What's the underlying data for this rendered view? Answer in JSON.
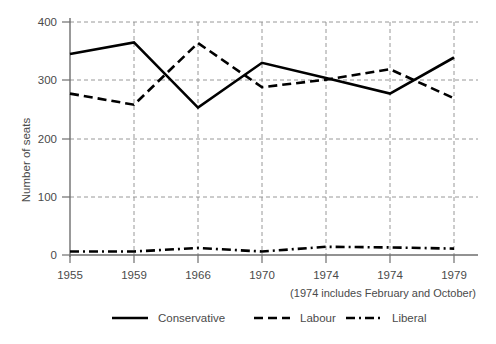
{
  "chart_data": {
    "type": "line",
    "title": "",
    "xlabel": "",
    "ylabel": "Number of seats",
    "categories": [
      "1955",
      "1959",
      "1966",
      "1970",
      "1974",
      "1974",
      "1979"
    ],
    "x_tick_labels": [
      "1955",
      "1959",
      "1966",
      "1970",
      "1974",
      "1974",
      "1979"
    ],
    "y_tick_labels": [
      "0",
      "100",
      "200",
      "300",
      "400"
    ],
    "ylim": [
      0,
      400
    ],
    "y_ticks": [
      0,
      100,
      200,
      300,
      400
    ],
    "grid": "horizontal-and-vertical-dashed",
    "legend_position": "bottom",
    "annotation": "(1974 includes February and October)",
    "series": [
      {
        "name": "Conservative",
        "style": "solid",
        "color": "#000000",
        "values": [
          345,
          365,
          253,
          330,
          304,
          277,
          339
        ]
      },
      {
        "name": "Labour",
        "style": "dashed",
        "color": "#000000",
        "values": [
          277,
          258,
          364,
          288,
          301,
          319,
          269
        ]
      },
      {
        "name": "Liberal",
        "style": "dash-dot",
        "color": "#000000",
        "values": [
          6,
          6,
          12,
          6,
          14,
          13,
          11
        ]
      }
    ]
  },
  "axis": {
    "y_title": "Number of seats"
  },
  "note": {
    "text": "(1974 includes February and October)"
  },
  "legend": {
    "items": [
      {
        "label": "Conservative",
        "style": "solid"
      },
      {
        "label": "Labour",
        "style": "dashed"
      },
      {
        "label": "Liberal",
        "style": "dash-dot"
      }
    ]
  },
  "ticks": {
    "y": [
      "400",
      "300",
      "200",
      "100",
      "0"
    ],
    "x": [
      "1955",
      "1959",
      "1966",
      "1970",
      "1974",
      "1974",
      "1979"
    ]
  }
}
